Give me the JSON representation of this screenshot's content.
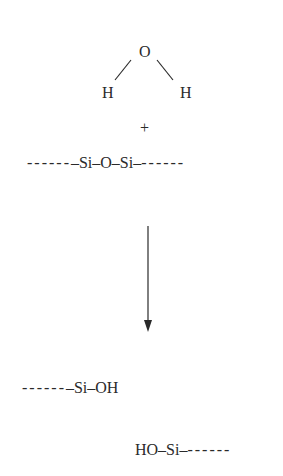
{
  "diagram": {
    "title": "",
    "reactants": {
      "water": {
        "center_atom": "O",
        "left_atom": "H",
        "right_atom": "H"
      },
      "plus_sign": "+",
      "siloxane": {
        "left_dashes": "------",
        "formula": "–Si–O–Si–",
        "right_dashes": "------"
      }
    },
    "arrow": {
      "direction": "down"
    },
    "products": {
      "silanol_1": {
        "left_dashes": "------",
        "formula": "–Si–OH"
      },
      "silanol_2": {
        "formula": "HO–Si–",
        "right_dashes": "------"
      }
    },
    "colors": {
      "ink": "#2a2a2a",
      "background": "#ffffff"
    }
  }
}
